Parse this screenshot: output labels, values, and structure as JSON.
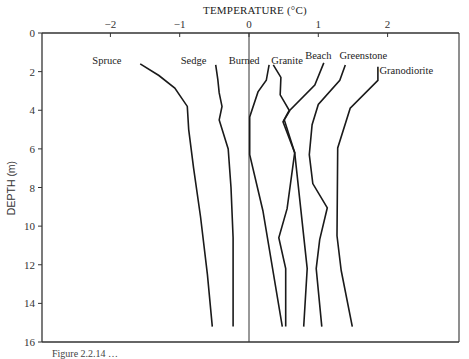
{
  "chart_data": {
    "type": "line",
    "title": "TEMPERATURE (°C)",
    "xlabel": "TEMPERATURE (°C)",
    "ylabel": "DEPTH (m)",
    "xlim": [
      -2.8,
      3.0
    ],
    "ylim": [
      0,
      16
    ],
    "y_inverted": true,
    "x_axis_position": "top",
    "x_ticks": [
      -2,
      -1,
      0,
      1,
      2
    ],
    "x_tick_labels": [
      "−2",
      "−1",
      "0",
      "1",
      "2"
    ],
    "y_ticks": [
      0,
      2,
      4,
      6,
      8,
      10,
      12,
      14,
      16
    ],
    "y_tick_labels": [
      "0",
      "2",
      "4",
      "6",
      "8",
      "10",
      "12",
      "14",
      "16"
    ],
    "grid": false,
    "reference_line": {
      "x": 0,
      "label": "0 °C"
    },
    "legend_position": "inline labels at top of each curve",
    "series": [
      {
        "name": "Spruce",
        "label_pos": [
          -2.05,
          1.45
        ],
        "points": [
          [
            -1.57,
            1.6
          ],
          [
            -1.3,
            2.2
          ],
          [
            -1.07,
            2.85
          ],
          [
            -0.89,
            3.8
          ],
          [
            -0.87,
            5.0
          ],
          [
            -0.8,
            7.0
          ],
          [
            -0.7,
            9.5
          ],
          [
            -0.6,
            12.5
          ],
          [
            -0.53,
            15.2
          ]
        ]
      },
      {
        "name": "Sedge",
        "label_pos": [
          -0.8,
          1.45
        ],
        "points": [
          [
            -0.48,
            1.65
          ],
          [
            -0.45,
            2.4
          ],
          [
            -0.43,
            3.1
          ],
          [
            -0.39,
            3.8
          ],
          [
            -0.43,
            4.5
          ],
          [
            -0.3,
            6.0
          ],
          [
            -0.26,
            8.0
          ],
          [
            -0.23,
            10.6
          ],
          [
            -0.23,
            15.2
          ]
        ]
      },
      {
        "name": "Burned",
        "label_pos": [
          -0.07,
          1.45
        ],
        "points": [
          [
            0.29,
            1.65
          ],
          [
            0.25,
            2.45
          ],
          [
            0.13,
            3.05
          ],
          [
            0.01,
            4.35
          ],
          [
            0.01,
            6.3
          ],
          [
            0.2,
            9.2
          ],
          [
            0.48,
            15.2
          ]
        ]
      },
      {
        "name": "Granite",
        "label_pos": [
          0.55,
          1.45
        ],
        "points": [
          [
            0.35,
            1.65
          ],
          [
            0.46,
            2.3
          ],
          [
            0.45,
            3.2
          ],
          [
            0.58,
            4.0
          ],
          [
            0.49,
            4.6
          ],
          [
            0.66,
            6.2
          ],
          [
            0.55,
            9.1
          ],
          [
            0.43,
            10.6
          ],
          [
            0.53,
            12.2
          ],
          [
            0.53,
            15.2
          ]
        ]
      },
      {
        "name": "Beach",
        "label_pos": [
          1.0,
          1.2
        ],
        "points": [
          [
            1.08,
            1.55
          ],
          [
            0.95,
            2.7
          ],
          [
            0.59,
            4.0
          ],
          [
            0.51,
            4.5
          ],
          [
            0.66,
            6.2
          ],
          [
            0.84,
            12.2
          ],
          [
            0.79,
            15.2
          ]
        ]
      },
      {
        "name": "Greenstone",
        "label_pos": [
          1.65,
          1.2
        ],
        "points": [
          [
            1.39,
            1.65
          ],
          [
            1.31,
            2.45
          ],
          [
            1.0,
            3.7
          ],
          [
            0.91,
            4.75
          ],
          [
            0.87,
            6.3
          ],
          [
            0.92,
            7.8
          ],
          [
            1.13,
            9.05
          ],
          [
            1.02,
            10.7
          ],
          [
            0.97,
            12.2
          ],
          [
            1.05,
            15.2
          ]
        ]
      },
      {
        "name": "Granodiorite",
        "label_pos": [
          2.27,
          1.95
        ],
        "points": [
          [
            1.86,
            1.75
          ],
          [
            1.86,
            2.45
          ],
          [
            1.46,
            3.9
          ],
          [
            1.28,
            5.95
          ],
          [
            1.27,
            10.5
          ],
          [
            1.33,
            12.3
          ],
          [
            1.49,
            15.2
          ]
        ]
      }
    ],
    "line_color": "#1a1a1a",
    "axis_color": "#333333"
  },
  "caption": "Figure 2.2.14 …"
}
